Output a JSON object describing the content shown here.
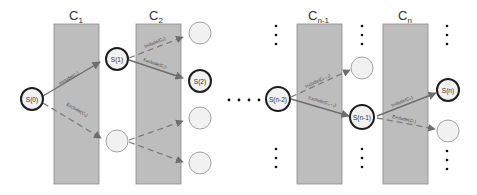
{
  "diagram": {
    "type": "state-transition-tree",
    "columns": [
      {
        "id": "c1",
        "label": "C",
        "sub": "1"
      },
      {
        "id": "c2",
        "label": "C",
        "sub": "2"
      },
      {
        "id": "cn1",
        "label": "C",
        "sub": "n-1"
      },
      {
        "id": "cn",
        "label": "C",
        "sub": "n"
      }
    ],
    "nodes": {
      "s0": "S(0)",
      "s1": "S(1)",
      "s2": "S(2)",
      "sn2": "S(n-2)",
      "sn1": "S(n-1)",
      "sn": "S(n)"
    },
    "edges": {
      "s0_include": "Include(C₁)",
      "s0_exclude": "Exclude(C₁)",
      "s1_include": "Include(C₂)",
      "s1_exclude": "Exclude(C₂)",
      "sn2_include": "Include(Cₙ₋₁)",
      "sn2_exclude": "Exclude(Cₙ₋₁)",
      "sn1_include": "Include(Cₙ)",
      "sn1_exclude": "Exclude(Cₙ)"
    },
    "ellipsis": "…"
  }
}
